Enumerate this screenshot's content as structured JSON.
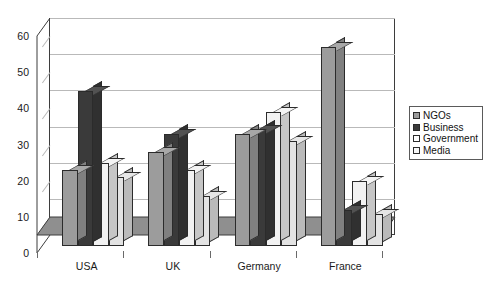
{
  "chart_data": {
    "type": "bar",
    "title": "",
    "subtitle": "",
    "xlabel": "",
    "ylabel": "",
    "categories": [
      "USA",
      "UK",
      "Germany",
      "France"
    ],
    "series": [
      {
        "name": "NGOs",
        "values": [
          21,
          26,
          31,
          55
        ],
        "color": "#9c9c9c"
      },
      {
        "name": "Business",
        "values": [
          43,
          31,
          32,
          10
        ],
        "color": "#3a3a3a"
      },
      {
        "name": "Government",
        "values": [
          23,
          21,
          37,
          18
        ],
        "color": "#f2f2f2"
      },
      {
        "name": "Media",
        "values": [
          19,
          14,
          29,
          9
        ],
        "color": "#e3e3e3"
      }
    ],
    "ylim": [
      0,
      60
    ],
    "yticks": [
      0,
      10,
      20,
      30,
      40,
      50,
      60
    ],
    "ytick_labels": [
      "0",
      "10",
      "20",
      "30",
      "40",
      "50",
      "60"
    ],
    "grid": true,
    "grid_axis": "y",
    "legend_position": "right",
    "style": "3d-column",
    "plot_background": "#ffffff",
    "grid_color": "#b9b9b9",
    "axis_color": "#3d3d3d",
    "floor_color": "#8f8f8f",
    "wall_color": "#ffffff"
  },
  "legend": {
    "items": [
      {
        "label": "NGOs",
        "swatch": "#9c9c9c"
      },
      {
        "label": "Business",
        "swatch": "#3a3a3a"
      },
      {
        "label": "Government",
        "swatch": "#ffffff"
      },
      {
        "label": "Media",
        "swatch": "#f7f7f7"
      }
    ]
  }
}
